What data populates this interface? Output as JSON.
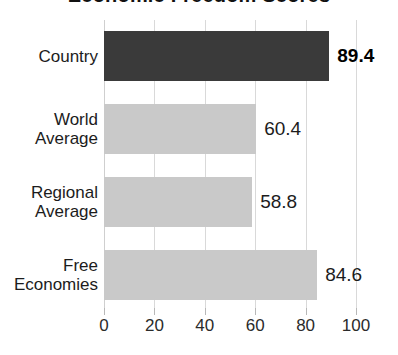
{
  "chart_data": {
    "type": "bar",
    "orientation": "horizontal",
    "title": "Economic Freedom Scores",
    "title_clipped": true,
    "categories": [
      "Country",
      "World Average",
      "Regional Average",
      "Free Economies"
    ],
    "values": [
      89.4,
      60.4,
      58.8,
      84.6
    ],
    "value_labels": [
      "89.4",
      "60.4",
      "58.8",
      "84.6"
    ],
    "xlabel": "",
    "ylabel": "",
    "xlim": [
      0,
      100
    ],
    "xticks": [
      0,
      20,
      40,
      60,
      80,
      100
    ],
    "xtick_labels": [
      "0",
      "20",
      "40",
      "60",
      "80",
      "100"
    ],
    "grid": true,
    "grid_axis": "x",
    "legend": false,
    "bar_colors": [
      "#3a3a3a",
      "#c9c9c9",
      "#c9c9c9",
      "#c9c9c9"
    ],
    "emphasized_index": 0,
    "series": [
      {
        "name": "Score",
        "values": [
          89.4,
          60.4,
          58.8,
          84.6
        ]
      }
    ]
  },
  "style": {
    "background": "#ffffff",
    "grid_color": "#d9d9d9",
    "text_color": "#1c1c1c",
    "accent_dark": "#3a3a3a",
    "accent_light": "#c9c9c9"
  }
}
